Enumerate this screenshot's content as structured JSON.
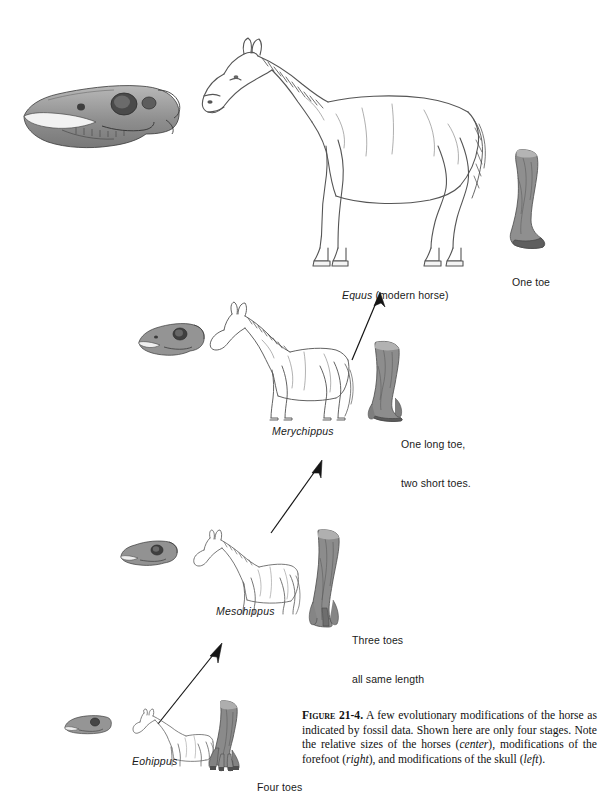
{
  "figure": {
    "number": "Figure 21-4.",
    "caption_text": " A few evolutionary modifications of the horse as indicated by fossil data. Shown here are only four stages. Note the relative sizes of the horses (",
    "caption_part1": " A few evolutionary modifications of the horse as indicated by fossil data. Shown here are only four stages. Note the relative sizes of the horses (",
    "caption_em1": "center",
    "caption_part2": "), modifications of the forefoot (",
    "caption_em2": "right",
    "caption_part3": "), and modifications of the skull (",
    "caption_em3": "left",
    "caption_part4": ")."
  },
  "stages": [
    {
      "id": "equus",
      "name": "Equus",
      "name_suffix": " (modern horse)",
      "foot_label": "One toe",
      "foot_label_line2": "",
      "skull": "horse-skull-equus",
      "body": "horse-body-equus",
      "foot": "forefoot-one-toe"
    },
    {
      "id": "merychippus",
      "name": "Merychippus",
      "name_suffix": "",
      "foot_label": "One long toe,",
      "foot_label_line2": "two short toes.",
      "skull": "horse-skull-merychippus",
      "body": "horse-body-merychippus",
      "foot": "forefoot-three-toe-uneven"
    },
    {
      "id": "mesohippus",
      "name": "Mesohippus",
      "name_suffix": "",
      "foot_label": "Three toes",
      "foot_label_line2": "all same length",
      "skull": "horse-skull-mesohippus",
      "body": "horse-body-mesohippus",
      "foot": "forefoot-three-toe-even"
    },
    {
      "id": "eohippus",
      "name": "Eohippus",
      "name_suffix": "",
      "foot_label": "Four toes",
      "foot_label_line2": "",
      "skull": "horse-skull-eohippus",
      "body": "horse-body-eohippus",
      "foot": "forefoot-four-toe"
    }
  ],
  "arrows": [
    {
      "id": "arrow-eohippus-to-mesohippus"
    },
    {
      "id": "arrow-mesohippus-to-merychippus"
    },
    {
      "id": "arrow-merychippus-to-equus"
    }
  ],
  "colors": {
    "ink": "#1a1a1a",
    "line": "#555555",
    "bone_fill": "#9a9a9a",
    "bone_dark": "#6e6e6e",
    "bone_light": "#c4c4c4",
    "paper": "#ffffff"
  }
}
